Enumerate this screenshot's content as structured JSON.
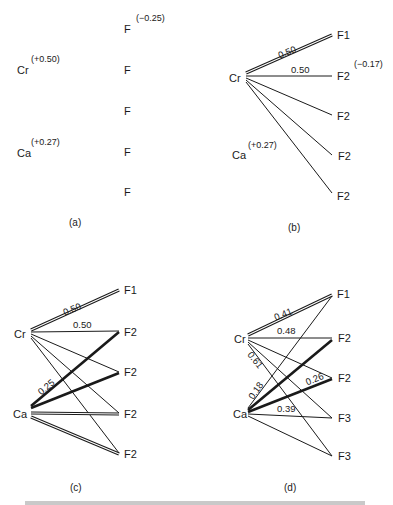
{
  "panels": {
    "a": {
      "caption": "(a)",
      "cation1": {
        "label": "Cr",
        "charge": "(+0.50)"
      },
      "cation2": {
        "label": "Ca",
        "charge": "(+0.27)"
      },
      "anion_charge": "(−0.25)",
      "anions": [
        "F",
        "F",
        "F",
        "F",
        "F"
      ]
    },
    "b": {
      "caption": "(b)",
      "cation1": {
        "label": "Cr"
      },
      "cation2": {
        "label": "Ca",
        "charge": "(+0.27)"
      },
      "anion_charge": "(−0.17)",
      "anions": [
        "F1",
        "F2",
        "F2",
        "F2",
        "F2"
      ],
      "bond_values": [
        "0.50",
        "0.50"
      ]
    },
    "c": {
      "caption": "(c)",
      "cation1": {
        "label": "Cr"
      },
      "cation2": {
        "label": "Ca"
      },
      "anions": [
        "F1",
        "F2",
        "F2",
        "F2",
        "F2"
      ],
      "bond_values": [
        "0.50",
        "0.50",
        "0.25"
      ]
    },
    "d": {
      "caption": "(d)",
      "cation1": {
        "label": "Cr"
      },
      "cation2": {
        "label": "Ca"
      },
      "anions": [
        "F1",
        "F2",
        "F2",
        "F3",
        "F3"
      ],
      "bond_values": [
        "0.41",
        "0.48",
        "0.61",
        "0.18",
        "0.26",
        "0.39"
      ]
    }
  }
}
